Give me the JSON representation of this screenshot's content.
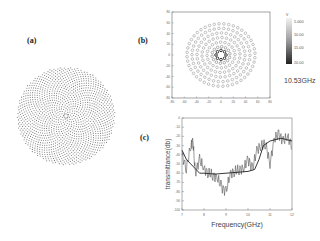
{
  "figure": {
    "panels": {
      "a": {
        "label": "(a)"
      },
      "b": {
        "label": "(b)",
        "annotation": "10.53GHz"
      },
      "c": {
        "label": "(c)"
      }
    }
  },
  "chart_data": [
    {
      "type": "scatter",
      "panel": "(a)",
      "title": "",
      "description": "Circular quasi-periodic dot lattice with small ring at center",
      "xlabel": "",
      "ylabel": "",
      "grid": false
    },
    {
      "type": "heatmap",
      "panel": "(b)",
      "title": "10.53GHz",
      "xlabel": "",
      "ylabel": "",
      "x_ticks": [
        -80,
        -60,
        -40,
        -20,
        0,
        20,
        40,
        60,
        80
      ],
      "y_ticks": [
        80,
        60,
        40,
        20,
        0,
        -20,
        -40,
        -60,
        -80
      ],
      "xlim": [
        -80,
        80
      ],
      "ylim": [
        -80,
        80
      ],
      "colorbar": {
        "unit": "V",
        "ticks": [
          "5.000",
          "10.00",
          "15.00",
          "20.00"
        ]
      },
      "grid": false
    },
    {
      "type": "line",
      "panel": "(c)",
      "title": "",
      "xlabel": "Frequency(GHz)",
      "ylabel": "transmittance(db)",
      "x_ticks": [
        7,
        8,
        9,
        10,
        11,
        12
      ],
      "y_ticks": [
        0,
        -10,
        -20,
        -30,
        -40,
        -50,
        -60,
        -70,
        -80,
        -90,
        -100
      ],
      "xlim": [
        7,
        12
      ],
      "ylim": [
        -100,
        0
      ],
      "series": [
        {
          "name": "measured",
          "x": [
            7.0,
            7.2,
            7.4,
            7.5,
            7.6,
            7.8,
            8.0,
            8.2,
            8.4,
            8.6,
            8.8,
            9.0,
            9.2,
            9.4,
            9.6,
            9.8,
            10.0,
            10.2,
            10.4,
            10.6,
            10.8,
            11.0,
            11.2,
            11.4,
            11.6,
            11.8,
            12.0
          ],
          "y": [
            -40,
            -55,
            -30,
            -25,
            -60,
            -45,
            -55,
            -60,
            -62,
            -65,
            -75,
            -80,
            -60,
            -58,
            -56,
            -55,
            -45,
            -55,
            -35,
            -30,
            -28,
            -50,
            -22,
            -18,
            -25,
            -20,
            -30
          ]
        },
        {
          "name": "simulated",
          "x": [
            7.0,
            7.2,
            7.4,
            7.6,
            7.8,
            8.0,
            8.5,
            9.0,
            9.5,
            10.0,
            10.3,
            10.5,
            10.7,
            11.0,
            11.5,
            12.0
          ],
          "y": [
            -35,
            -45,
            -50,
            -55,
            -60,
            -60,
            -61,
            -60,
            -59,
            -58,
            -56,
            -45,
            -30,
            -25,
            -22,
            -25
          ]
        }
      ],
      "grid": false
    }
  ]
}
